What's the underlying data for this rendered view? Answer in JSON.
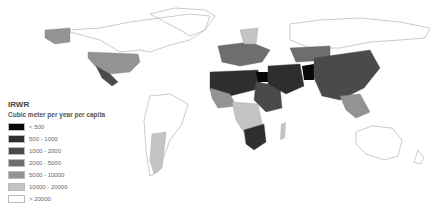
{
  "map": {
    "title": "IRWR",
    "subtitle": "Cubic meter per year per capita",
    "legend": [
      {
        "label": "< 500",
        "color": "#080808"
      },
      {
        "label": "500 - 1000",
        "color": "#2e2e2e"
      },
      {
        "label": "1000 - 2000",
        "color": "#4a4a4a"
      },
      {
        "label": "2000 - 5000",
        "color": "#6e6e6e"
      },
      {
        "label": "5000 - 10000",
        "color": "#939393"
      },
      {
        "label": "10000 - 20000",
        "color": "#c4c4c4"
      },
      {
        "label": "> 20000",
        "color": "#ffffff"
      }
    ],
    "outline_color": "#9a9a9a"
  }
}
